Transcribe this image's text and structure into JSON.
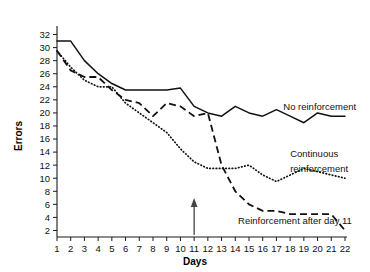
{
  "chart_data": {
    "type": "line",
    "title": "",
    "xlabel": "Days",
    "ylabel": "Errors",
    "x": [
      1,
      2,
      3,
      4,
      5,
      6,
      7,
      8,
      9,
      10,
      11,
      12,
      13,
      14,
      15,
      16,
      17,
      18,
      19,
      20,
      21,
      22
    ],
    "xlim": [
      1,
      22
    ],
    "ylim": [
      1,
      33
    ],
    "yticks": [
      2,
      4,
      6,
      8,
      10,
      12,
      14,
      16,
      18,
      20,
      22,
      24,
      26,
      28,
      30,
      32
    ],
    "xticks": [
      1,
      2,
      3,
      4,
      5,
      6,
      7,
      8,
      9,
      10,
      11,
      12,
      13,
      14,
      15,
      16,
      17,
      18,
      19,
      20,
      21,
      22
    ],
    "grid": false,
    "legend_position": "inline-right",
    "series": [
      {
        "name": "No reinforcement",
        "style": "solid",
        "values": [
          31,
          31,
          28,
          26,
          24.5,
          23.5,
          23.5,
          23.5,
          23.5,
          23.8,
          21,
          20,
          19.5,
          21,
          20,
          19.5,
          20.5,
          19.5,
          18.5,
          20,
          19.5,
          19.5
        ]
      },
      {
        "name": "Continuous reinforcement",
        "style": "dotted",
        "values": [
          29.5,
          27,
          25,
          24,
          24,
          21.5,
          20,
          18.5,
          17,
          14.5,
          12.5,
          11.5,
          11.5,
          11.5,
          12,
          10.5,
          9.5,
          10.5,
          11.5,
          11,
          10.5,
          10
        ]
      },
      {
        "name": "Reinforcement after day 11",
        "style": "dashed",
        "values": [
          29.5,
          26.5,
          25.5,
          25.5,
          23.5,
          22,
          21.5,
          19.5,
          21.5,
          21,
          19.5,
          20,
          12,
          8,
          6,
          5,
          5,
          4.5,
          4.5,
          4.5,
          4.5,
          2
        ]
      }
    ],
    "annotations": [
      {
        "name": "no-reinforcement-label",
        "text": "No reinforcement",
        "x": 17.5,
        "y": 20.5
      },
      {
        "name": "continuous-reinforcement-label-line1",
        "text": "Continuous",
        "x": 18.0,
        "y": 13.2
      },
      {
        "name": "continuous-reinforcement-label-line2",
        "text": "reinforcement",
        "x": 18.0,
        "y": 11.0
      },
      {
        "name": "reinforcement-after-day-11-label",
        "text": "Reinforcement after day 11",
        "x": 14.2,
        "y": 3.0
      },
      {
        "name": "day-11-arrow",
        "text": "",
        "x": 11,
        "y": 6.5
      }
    ]
  }
}
